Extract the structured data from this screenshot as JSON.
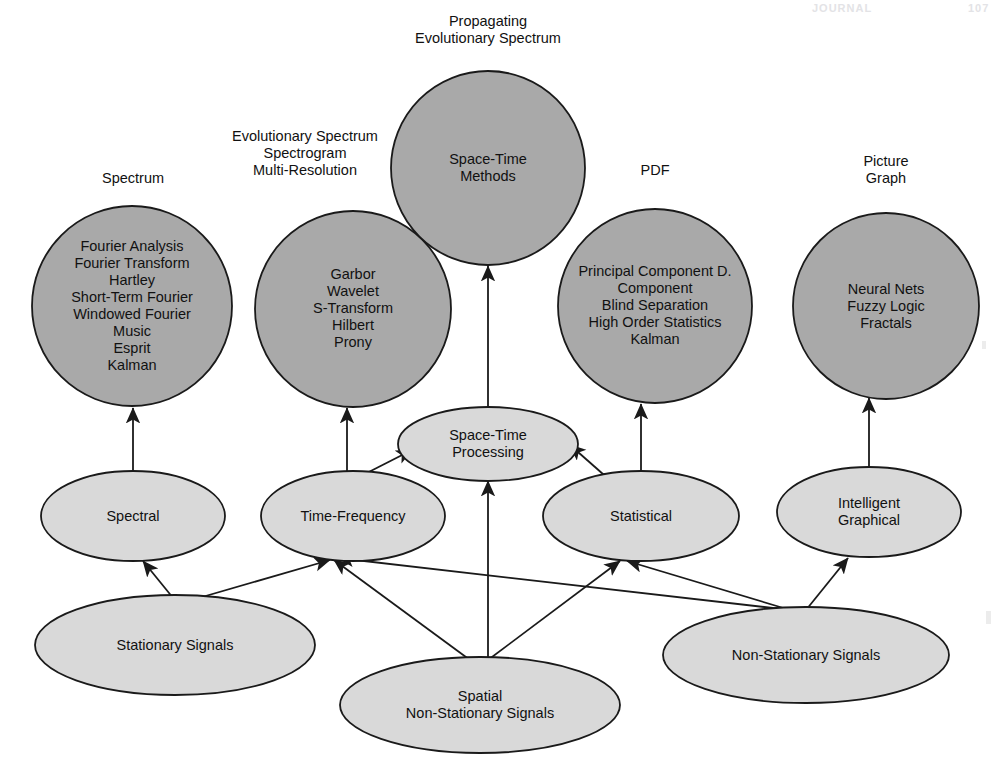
{
  "page": {
    "header_left": "JOURNAL",
    "header_right": "107"
  },
  "colors": {
    "circle_fill": "#a9a9a9",
    "ellipse_fill": "#d9d9d9",
    "stroke": "#1a1a1a",
    "text": "#111111",
    "background": "#ffffff"
  },
  "captions": [
    {
      "id": "cap-spectrum",
      "text": "Spectrum"
    },
    {
      "id": "cap-evolutionary",
      "text": "Evolutionary Spectrum\nSpectrogram\nMulti-Resolution"
    },
    {
      "id": "cap-propagating",
      "text": "Propagating\nEvolutionary Spectrum"
    },
    {
      "id": "cap-pdf",
      "text": "PDF"
    },
    {
      "id": "cap-picture-graph",
      "text": "Picture\nGraph"
    }
  ],
  "method_circles": [
    {
      "id": "circle-spectrum",
      "name": "spectrum-methods-circle",
      "cx": 132,
      "cy": 306,
      "r": 100,
      "items": [
        "Fourier Analysis",
        "Fourier Transform",
        "Hartley",
        "Short-Term Fourier",
        "Windowed Fourier",
        "Music",
        "Esprit",
        "Kalman"
      ],
      "text": "Fourier Analysis\nFourier Transform\nHartley\nShort-Term Fourier\nWindowed Fourier\nMusic\nEsprit\nKalman"
    },
    {
      "id": "circle-time-frequency",
      "name": "time-frequency-methods-circle",
      "cx": 353,
      "cy": 309,
      "r": 98,
      "items": [
        "Garbor",
        "Wavelet",
        "S-Transform",
        "Hilbert",
        "Prony"
      ],
      "text": "Garbor\nWavelet\nS-Transform\nHilbert\nProny"
    },
    {
      "id": "circle-space-time",
      "name": "space-time-methods-circle",
      "cx": 488,
      "cy": 168,
      "r": 97,
      "items": [
        "Space-Time",
        "Methods"
      ],
      "text": "Space-Time\nMethods"
    },
    {
      "id": "circle-pdf",
      "name": "pdf-methods-circle",
      "cx": 655,
      "cy": 306,
      "r": 97,
      "items": [
        "Principal Component D.",
        "Component",
        "Blind Separation",
        "High Order Statistics",
        "Kalman"
      ],
      "text": "Principal Component D.\nComponent\nBlind Separation\nHigh Order Statistics\nKalman"
    },
    {
      "id": "circle-picture-graph",
      "name": "intelligent-graphical-methods-circle",
      "cx": 886,
      "cy": 306,
      "r": 93,
      "items": [
        "Neural Nets",
        "Fuzzy Logic",
        "Fractals"
      ],
      "text": "Neural Nets\nFuzzy Logic\nFractals"
    }
  ],
  "category_ellipses": [
    {
      "id": "ell-spectral",
      "name": "spectral-category",
      "cx": 133,
      "cy": 516,
      "rx": 92,
      "ry": 45,
      "text": "Spectral"
    },
    {
      "id": "ell-time-frequency",
      "name": "time-frequency-category",
      "cx": 353,
      "cy": 516,
      "rx": 92,
      "ry": 45,
      "text": "Time-Frequency"
    },
    {
      "id": "ell-space-time-proc",
      "name": "space-time-processing-category",
      "cx": 488,
      "cy": 444,
      "rx": 90,
      "ry": 37,
      "text": "Space-Time\nProcessing"
    },
    {
      "id": "ell-statistical",
      "name": "statistical-category",
      "cx": 641,
      "cy": 516,
      "rx": 98,
      "ry": 45,
      "text": "Statistical"
    },
    {
      "id": "ell-intelligent",
      "name": "intelligent-graphical-category",
      "cx": 869,
      "cy": 512,
      "rx": 92,
      "ry": 45,
      "text": "Intelligent\nGraphical"
    }
  ],
  "signal_ellipses": [
    {
      "id": "ell-stationary",
      "name": "stationary-signals-source",
      "cx": 175,
      "cy": 645,
      "rx": 140,
      "ry": 50,
      "text": "Stationary Signals"
    },
    {
      "id": "ell-spatial-nonstat",
      "name": "spatial-non-stationary-signals-source",
      "cx": 480,
      "cy": 705,
      "rx": 140,
      "ry": 48,
      "text": "Spatial\nNon-Stationary Signals"
    },
    {
      "id": "ell-nonstationary",
      "name": "non-stationary-signals-source",
      "cx": 806,
      "cy": 655,
      "rx": 143,
      "ry": 48,
      "text": "Non-Stationary Signals"
    }
  ],
  "edges": [
    {
      "id": "e1",
      "name": "edge-spectral-to-spectrum",
      "from": "Spectral",
      "to": "Spectrum methods",
      "x1": 133,
      "y1": 471,
      "x2": 133,
      "y2": 408
    },
    {
      "id": "e2",
      "name": "edge-time-frequency-to-methods",
      "from": "Time-Frequency",
      "to": "Garbor methods",
      "x1": 347,
      "y1": 471,
      "x2": 347,
      "y2": 408
    },
    {
      "id": "e3",
      "name": "edge-space-time-processing-to-space-time-methods",
      "from": "Space-Time Processing",
      "to": "Space-Time Methods",
      "x1": 488,
      "y1": 407,
      "x2": 488,
      "y2": 266
    },
    {
      "id": "e4",
      "name": "edge-statistical-to-pdf",
      "from": "Statistical",
      "to": "PDF methods",
      "x1": 641,
      "y1": 471,
      "x2": 641,
      "y2": 404
    },
    {
      "id": "e5",
      "name": "edge-intelligent-to-picture-graph",
      "from": "Intelligent Graphical",
      "to": "Picture Graph methods",
      "x1": 869,
      "y1": 467,
      "x2": 869,
      "y2": 398
    },
    {
      "id": "e6",
      "name": "edge-time-frequency-to-space-time-processing",
      "from": "Time-Frequency",
      "to": "Space-Time Processing",
      "x1": 357,
      "y1": 478,
      "x2": 412,
      "y2": 450
    },
    {
      "id": "e7",
      "name": "edge-statistical-to-space-time-processing",
      "from": "Statistical",
      "to": "Space-Time Processing",
      "x1": 612,
      "y1": 482,
      "x2": 570,
      "y2": 445
    },
    {
      "id": "e8",
      "name": "edge-spatial-to-space-time-processing",
      "from": "Spatial Non-Stationary Signals",
      "to": "Space-Time Processing",
      "x1": 488,
      "y1": 660,
      "x2": 488,
      "y2": 481
    },
    {
      "id": "e9",
      "name": "edge-stationary-to-spectral",
      "from": "Stationary Signals",
      "to": "Spectral",
      "x1": 178,
      "y1": 604,
      "x2": 143,
      "y2": 561
    },
    {
      "id": "e10",
      "name": "edge-stationary-to-time-frequency",
      "from": "Stationary Signals",
      "to": "Time-Frequency",
      "x1": 178,
      "y1": 604,
      "x2": 330,
      "y2": 560
    },
    {
      "id": "e11",
      "name": "edge-spatial-to-time-frequency",
      "from": "Spatial Non-Stationary Signals",
      "to": "Time-Frequency",
      "x1": 470,
      "y1": 660,
      "x2": 334,
      "y2": 560
    },
    {
      "id": "e12",
      "name": "edge-spatial-to-statistical",
      "from": "Spatial Non-Stationary Signals",
      "to": "Statistical",
      "x1": 488,
      "y1": 660,
      "x2": 620,
      "y2": 561
    },
    {
      "id": "e13",
      "name": "edge-non-stationary-to-time-frequency",
      "from": "Non-Stationary Signals",
      "to": "Time-Frequency",
      "x1": 790,
      "y1": 610,
      "x2": 338,
      "y2": 558
    },
    {
      "id": "e14",
      "name": "edge-non-stationary-to-statistical",
      "from": "Non-Stationary Signals",
      "to": "Statistical",
      "x1": 790,
      "y1": 610,
      "x2": 627,
      "y2": 561
    },
    {
      "id": "e15",
      "name": "edge-non-stationary-to-intelligent",
      "from": "Non-Stationary Signals",
      "to": "Intelligent Graphical",
      "x1": 806,
      "y1": 610,
      "x2": 848,
      "y2": 558
    }
  ]
}
